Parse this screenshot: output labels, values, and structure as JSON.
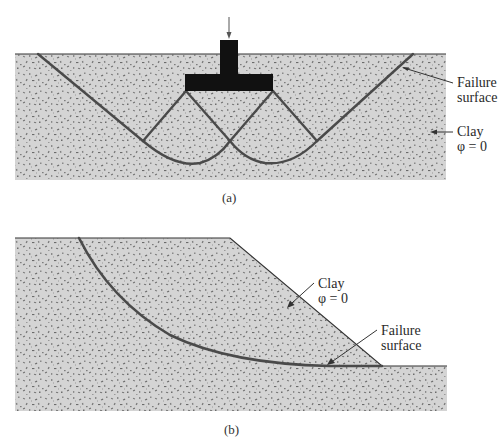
{
  "colors": {
    "soil_fill": "#d4d4d4",
    "speckle": "#7a7a7a",
    "failure_line": "#4a4a4a",
    "outline": "#333333",
    "footing": "#111111",
    "text": "#2a2a2a"
  },
  "figure_a": {
    "caption": "(a)",
    "labels": {
      "failure_line1": "Failure",
      "failure_line2": "surface",
      "clay_line1": "Clay",
      "clay_line2": "φ = 0"
    }
  },
  "figure_b": {
    "caption": "(b)",
    "labels": {
      "clay_line1": "Clay",
      "clay_line2": "φ = 0",
      "failure_line1": "Failure",
      "failure_line2": "surface"
    }
  }
}
